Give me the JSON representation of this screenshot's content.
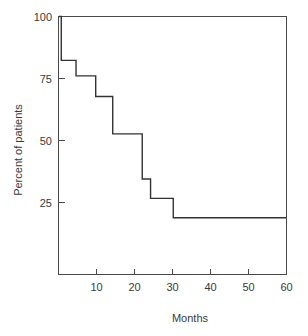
{
  "chart_data": {
    "type": "line",
    "subtype": "kaplan-meier-step",
    "title": "",
    "xlabel": "Months",
    "ylabel": "Percent of patients",
    "xlim": [
      0,
      60
    ],
    "ylim": [
      0,
      100
    ],
    "grid": false,
    "legend": null,
    "x_ticks": [
      10,
      20,
      30,
      40,
      50,
      60
    ],
    "x_tick_labels": [
      "10",
      "20",
      "30",
      "40",
      "50",
      "60"
    ],
    "y_ticks": [
      25,
      50,
      75,
      100
    ],
    "y_tick_labels": [
      "25",
      "50",
      "75",
      "100"
    ],
    "series": [
      {
        "name": "Percent of patients",
        "color": "#333333",
        "step": "post",
        "x": [
          0,
          0.6,
          4.5,
          9.7,
          14.2,
          22.0,
          24.2,
          30.2,
          60
        ],
        "y": [
          100,
          83,
          77,
          69,
          54.5,
          37,
          29.5,
          22,
          22
        ],
        "points": [
          {
            "months": 0,
            "percent": 100
          },
          {
            "months": 0.6,
            "percent": 83
          },
          {
            "months": 4.5,
            "percent": 77
          },
          {
            "months": 9.7,
            "percent": 69
          },
          {
            "months": 14.2,
            "percent": 54.5
          },
          {
            "months": 22.0,
            "percent": 37
          },
          {
            "months": 24.2,
            "percent": 29.5
          },
          {
            "months": 30.2,
            "percent": 22
          },
          {
            "months": 60,
            "percent": 22
          }
        ]
      }
    ]
  },
  "axes": {
    "x_title": "Months",
    "y_title": "Percent of patients"
  },
  "colors": {
    "curve": "#333333",
    "axis": "#4a4a4a",
    "text": "#3a3a3a",
    "background": "#ffffff"
  }
}
